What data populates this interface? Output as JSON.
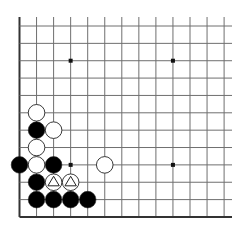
{
  "board": {
    "title": "Go problem diagram (lower-left corner)",
    "colors": {
      "background": "#ffffff",
      "line": "#6f6f6f",
      "edge": "#333333",
      "black_stone": "#000000",
      "white_stone": "#ffffff",
      "stone_outline": "#222222",
      "star": "#111111"
    },
    "geometry": {
      "origin_x": 19.5,
      "origin_y": 26,
      "col_spacing": 17.05,
      "row_spacing": 17.36,
      "cols": 13,
      "rows": 12,
      "line_top_extent": 17,
      "line_right_extent": 232,
      "stone_radius": 8.3
    },
    "edges": [
      "left",
      "bottom"
    ],
    "star_points": [
      {
        "col": 3,
        "row": 2
      },
      {
        "col": 9,
        "row": 2
      },
      {
        "col": 3,
        "row": 8
      },
      {
        "col": 9,
        "row": 8
      }
    ],
    "stones": [
      {
        "color": "white",
        "col": 1,
        "row": 5,
        "marker": ""
      },
      {
        "color": "black",
        "col": 1,
        "row": 6,
        "marker": ""
      },
      {
        "color": "white",
        "col": 2,
        "row": 6,
        "marker": ""
      },
      {
        "color": "white",
        "col": 1,
        "row": 7,
        "marker": ""
      },
      {
        "color": "black",
        "col": 0,
        "row": 8,
        "marker": ""
      },
      {
        "color": "white",
        "col": 1,
        "row": 8,
        "marker": ""
      },
      {
        "color": "black",
        "col": 2,
        "row": 8,
        "marker": ""
      },
      {
        "color": "white",
        "col": 5,
        "row": 8,
        "marker": ""
      },
      {
        "color": "black",
        "col": 1,
        "row": 9,
        "marker": ""
      },
      {
        "color": "white",
        "col": 2,
        "row": 9,
        "marker": "triangle"
      },
      {
        "color": "white",
        "col": 3,
        "row": 9,
        "marker": "triangle"
      },
      {
        "color": "black",
        "col": 1,
        "row": 10,
        "marker": ""
      },
      {
        "color": "black",
        "col": 2,
        "row": 10,
        "marker": ""
      },
      {
        "color": "black",
        "col": 3,
        "row": 10,
        "marker": ""
      },
      {
        "color": "black",
        "col": 4,
        "row": 10,
        "marker": ""
      }
    ]
  }
}
